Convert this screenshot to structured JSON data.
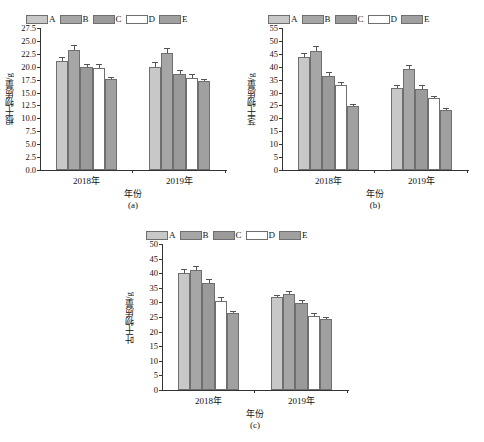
{
  "figure": {
    "background": "#ffffff",
    "series_colors": {
      "A": "#c8c8c8",
      "B": "#a6a6a6",
      "C": "#9a9a9a",
      "D": "#ffffff",
      "E": "#a0a0a0"
    },
    "legend_labels": [
      "A",
      "B",
      "C",
      "D",
      "E"
    ],
    "xlabel": "年份",
    "categories": [
      "2018年",
      "2019年"
    ]
  },
  "chart_data": [
    {
      "id": "a",
      "type": "bar",
      "title": "",
      "panel_label": "(a)",
      "xlabel": "年份",
      "ylabel": "根干物质量/g",
      "categories": [
        "2018年",
        "2019年"
      ],
      "ylim": [
        0,
        27.5
      ],
      "ytick_step": 2.5,
      "yticks": [
        "0.0",
        "2.5",
        "5.0",
        "7.5",
        "10.0",
        "12.5",
        "15.0",
        "17.5",
        "20.0",
        "22.5",
        "25.0",
        "27.5"
      ],
      "grid": false,
      "legend_position": "top-center",
      "series": [
        {
          "name": "A",
          "values": [
            21.1,
            20.0
          ],
          "errors": [
            0.75,
            0.85
          ]
        },
        {
          "name": "B",
          "values": [
            23.2,
            22.6
          ],
          "errors": [
            1.05,
            1.0
          ]
        },
        {
          "name": "C",
          "values": [
            20.0,
            18.6
          ],
          "errors": [
            0.6,
            0.7
          ]
        },
        {
          "name": "D",
          "values": [
            19.7,
            17.9
          ],
          "errors": [
            0.85,
            0.6
          ]
        },
        {
          "name": "E",
          "values": [
            17.6,
            17.2
          ],
          "errors": [
            0.45,
            0.5
          ]
        }
      ]
    },
    {
      "id": "b",
      "type": "bar",
      "title": "",
      "panel_label": "(b)",
      "xlabel": "年份",
      "ylabel": "茎干物质量/g",
      "categories": [
        "2018年",
        "2019年"
      ],
      "ylim": [
        0,
        55
      ],
      "ytick_step": 5,
      "yticks": [
        "0",
        "5",
        "10",
        "15",
        "20",
        "25",
        "30",
        "35",
        "40",
        "45",
        "50",
        "55"
      ],
      "grid": false,
      "legend_position": "top-center",
      "series": [
        {
          "name": "A",
          "values": [
            43.7,
            31.9
          ],
          "errors": [
            1.5,
            1.2
          ]
        },
        {
          "name": "B",
          "values": [
            46.1,
            39.2
          ],
          "errors": [
            1.8,
            1.5
          ]
        },
        {
          "name": "C",
          "values": [
            36.5,
            31.5
          ],
          "errors": [
            1.4,
            1.3
          ]
        },
        {
          "name": "D",
          "values": [
            33.0,
            27.8
          ],
          "errors": [
            1.1,
            0.9
          ]
        },
        {
          "name": "E",
          "values": [
            24.6,
            23.2
          ],
          "errors": [
            0.8,
            0.8
          ]
        }
      ]
    },
    {
      "id": "c",
      "type": "bar",
      "title": "",
      "panel_label": "(c)",
      "xlabel": "年份",
      "ylabel": "叶干物质量/g",
      "categories": [
        "2018年",
        "2019年"
      ],
      "ylim": [
        0,
        50
      ],
      "ytick_step": 5,
      "yticks": [
        "0",
        "5",
        "10",
        "15",
        "20",
        "25",
        "30",
        "35",
        "40",
        "45",
        "50"
      ],
      "grid": false,
      "legend_position": "top-center",
      "series": [
        {
          "name": "A",
          "values": [
            40.2,
            31.7
          ],
          "errors": [
            1.2,
            0.9
          ]
        },
        {
          "name": "B",
          "values": [
            41.0,
            32.8
          ],
          "errors": [
            1.3,
            1.1
          ]
        },
        {
          "name": "C",
          "values": [
            36.7,
            29.7
          ],
          "errors": [
            1.2,
            1.2
          ]
        },
        {
          "name": "D",
          "values": [
            30.6,
            25.5
          ],
          "errors": [
            1.3,
            1.0
          ]
        },
        {
          "name": "E",
          "values": [
            26.3,
            24.3
          ],
          "errors": [
            0.9,
            0.7
          ]
        }
      ]
    }
  ]
}
